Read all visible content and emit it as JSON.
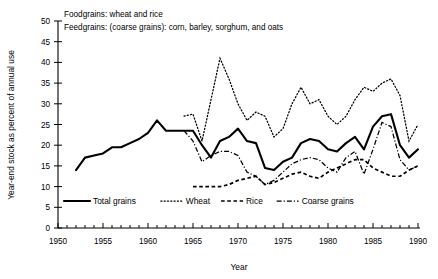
{
  "notes": {
    "line1": "Foodgrains: wheat and rice",
    "line2": "Feedgrains: (coarse grains): corn, barley, sorghum, and oats"
  },
  "axes": {
    "ylabel": "Year-end stock as percent of annual use",
    "xlabel": "Year",
    "yticks": [
      "0",
      "5",
      "10",
      "15",
      "20",
      "25",
      "30",
      "35",
      "40",
      "45",
      "50"
    ],
    "xticks": [
      "1950",
      "1955",
      "1960",
      "1965",
      "1970",
      "1975",
      "1980",
      "1985",
      "1990"
    ]
  },
  "legend": {
    "items": [
      {
        "label": "Total grains",
        "style": "solid"
      },
      {
        "label": "Wheat",
        "style": "dotted"
      },
      {
        "label": "Rice",
        "style": "dashed"
      },
      {
        "label": "Coarse grains",
        "style": "dash-dot"
      }
    ]
  },
  "chart_data": {
    "type": "line",
    "title": "",
    "xlabel": "Year",
    "ylabel": "Year-end stock as percent of annual use",
    "xlim": [
      1950,
      1990
    ],
    "ylim": [
      0,
      50
    ],
    "ytick_step": 5,
    "xtick_step": 5,
    "minor_xticks": 1,
    "grid": false,
    "legend_position": "bottom-inside",
    "colors": {
      "all_series": "#000000"
    },
    "series": [
      {
        "name": "Total grains",
        "style": "solid",
        "x": [
          1952,
          1953,
          1954,
          1955,
          1956,
          1957,
          1958,
          1959,
          1960,
          1961,
          1962,
          1963,
          1964,
          1965,
          1966,
          1967,
          1968,
          1969,
          1970,
          1971,
          1972,
          1973,
          1974,
          1975,
          1976,
          1977,
          1978,
          1979,
          1980,
          1981,
          1982,
          1983,
          1984,
          1985,
          1986,
          1987,
          1988,
          1989,
          1990
        ],
        "y": [
          14.0,
          17.0,
          17.5,
          18.0,
          19.5,
          19.5,
          20.5,
          21.5,
          23.0,
          26.0,
          23.5,
          23.5,
          23.5,
          23.5,
          20.0,
          17.0,
          21.0,
          22.0,
          24.0,
          21.0,
          20.5,
          14.5,
          14.0,
          16.0,
          17.0,
          20.5,
          21.5,
          21.0,
          19.0,
          18.5,
          20.5,
          22.0,
          19.0,
          24.5,
          27.0,
          27.5,
          20.0,
          17.0,
          19.0
        ]
      },
      {
        "name": "Wheat",
        "style": "dotted",
        "x": [
          1964,
          1965,
          1966,
          1967,
          1968,
          1969,
          1970,
          1971,
          1972,
          1973,
          1974,
          1975,
          1976,
          1977,
          1978,
          1979,
          1980,
          1981,
          1982,
          1983,
          1984,
          1985,
          1986,
          1987,
          1988,
          1989,
          1990
        ],
        "y": [
          27.0,
          27.5,
          21.0,
          31.0,
          41.0,
          36.0,
          30.0,
          26.0,
          28.0,
          27.0,
          22.0,
          24.0,
          30.0,
          34.0,
          30.0,
          31.0,
          27.0,
          25.0,
          27.0,
          31.0,
          34.0,
          33.0,
          35.0,
          36.0,
          32.0,
          21.0,
          25.0
        ]
      },
      {
        "name": "Rice",
        "style": "dashed",
        "x": [
          1965,
          1966,
          1967,
          1968,
          1969,
          1970,
          1971,
          1972,
          1973,
          1974,
          1975,
          1976,
          1977,
          1978,
          1979,
          1980,
          1981,
          1982,
          1983,
          1984,
          1985,
          1986,
          1987,
          1988,
          1989,
          1990
        ],
        "y": [
          10.0,
          10.0,
          10.0,
          10.0,
          10.5,
          11.5,
          12.0,
          12.5,
          10.5,
          11.0,
          12.0,
          13.0,
          13.5,
          12.5,
          12.0,
          13.5,
          14.5,
          15.5,
          16.5,
          16.5,
          14.5,
          13.5,
          12.5,
          12.5,
          14.0,
          15.0
        ]
      },
      {
        "name": "Coarse grains",
        "style": "dash-dot",
        "x": [
          1964,
          1965,
          1966,
          1967,
          1968,
          1969,
          1970,
          1971,
          1972,
          1973,
          1974,
          1975,
          1976,
          1977,
          1978,
          1979,
          1980,
          1981,
          1982,
          1983,
          1984,
          1985,
          1986,
          1987,
          1988,
          1989,
          1990
        ],
        "y": [
          23.5,
          21.0,
          16.0,
          17.5,
          18.5,
          18.5,
          17.5,
          13.5,
          12.5,
          10.5,
          11.5,
          13.5,
          15.5,
          16.5,
          17.0,
          16.5,
          14.5,
          13.5,
          17.0,
          18.5,
          13.0,
          19.0,
          25.5,
          24.5,
          16.5,
          14.0,
          15.0
        ]
      }
    ]
  }
}
